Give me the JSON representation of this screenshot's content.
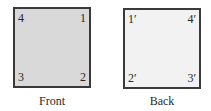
{
  "front": {
    "caption": "Front",
    "fill": "#d9d9d9",
    "corners": {
      "top_left": "4",
      "top_right": "1",
      "bottom_left": "3",
      "bottom_right": "2"
    }
  },
  "back": {
    "caption": "Back",
    "fill": "#f2f2f2",
    "corners": {
      "top_left": "1′",
      "top_right": "4′",
      "bottom_left": "2′",
      "bottom_right": "3′"
    }
  }
}
